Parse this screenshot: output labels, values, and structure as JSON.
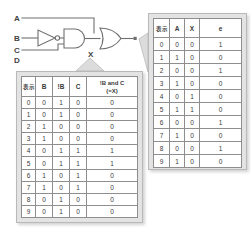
{
  "diagram": {
    "type": "logic-circuit-with-truth-tables",
    "inputs": [
      "A",
      "B",
      "C",
      "D"
    ],
    "gates": [
      {
        "name": "inverter",
        "symbol": "NOT",
        "input": "B",
        "output": "!B"
      },
      {
        "name": "and-gate",
        "symbol": "AND",
        "inputs": [
          "!B",
          "C"
        ],
        "output": "X"
      },
      {
        "name": "or-gate",
        "symbol": "OR",
        "inputs": [
          "A",
          "X"
        ],
        "output": "e"
      }
    ],
    "node_label_x": "X",
    "output_label": "e"
  },
  "left_table": {
    "caption_col": "表示",
    "headers": [
      "表示",
      "B",
      "!B",
      "C",
      "!B and C"
    ],
    "header_sub": "(=X)",
    "rows": [
      {
        "idx": "0",
        "b": "0",
        "nb": "1",
        "c": "0",
        "x": "0"
      },
      {
        "idx": "1",
        "b": "0",
        "nb": "1",
        "c": "0",
        "x": "0"
      },
      {
        "idx": "2",
        "b": "1",
        "nb": "0",
        "c": "0",
        "x": "0"
      },
      {
        "idx": "3",
        "b": "1",
        "nb": "0",
        "c": "0",
        "x": "0"
      },
      {
        "idx": "4",
        "b": "0",
        "nb": "1",
        "c": "1",
        "x": "1"
      },
      {
        "idx": "5",
        "b": "0",
        "nb": "1",
        "c": "1",
        "x": "1"
      },
      {
        "idx": "6",
        "b": "1",
        "nb": "0",
        "c": "1",
        "x": "0"
      },
      {
        "idx": "7",
        "b": "1",
        "nb": "0",
        "c": "1",
        "x": "0"
      },
      {
        "idx": "8",
        "b": "0",
        "nb": "1",
        "c": "0",
        "x": "0"
      },
      {
        "idx": "9",
        "b": "0",
        "nb": "1",
        "c": "0",
        "x": "0"
      }
    ]
  },
  "right_table": {
    "caption_col": "表示",
    "headers": [
      "表示",
      "A",
      "X",
      "e"
    ],
    "rows": [
      {
        "idx": "0",
        "a": "0",
        "x": "0",
        "e": "1"
      },
      {
        "idx": "1",
        "a": "1",
        "x": "0",
        "e": "0"
      },
      {
        "idx": "2",
        "a": "0",
        "x": "0",
        "e": "1"
      },
      {
        "idx": "3",
        "a": "1",
        "x": "0",
        "e": "0"
      },
      {
        "idx": "4",
        "a": "0",
        "x": "1",
        "e": "0"
      },
      {
        "idx": "5",
        "a": "1",
        "x": "1",
        "e": "0"
      },
      {
        "idx": "6",
        "a": "0",
        "x": "0",
        "e": "1"
      },
      {
        "idx": "7",
        "a": "1",
        "x": "0",
        "e": "0"
      },
      {
        "idx": "8",
        "a": "0",
        "x": "0",
        "e": "1"
      },
      {
        "idx": "9",
        "a": "1",
        "x": "0",
        "e": "0"
      }
    ]
  },
  "colors": {
    "line": "#6f6f6f",
    "panel_bg": "#e3e3e3",
    "cell_border": "#8e8e8e",
    "text": "#3a3a3a",
    "callout_fill": "#dcdcdc"
  }
}
